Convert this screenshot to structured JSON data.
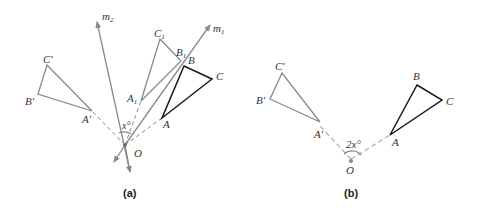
{
  "panel_a": {
    "caption": "(a)",
    "labels": {
      "m2": "m",
      "m2_sub": "2",
      "m1": "m",
      "m1_sub": "1",
      "C1": "C",
      "C1_sub": "1",
      "B1": "B",
      "B1_sub": "1",
      "A1": "A",
      "A1_sub": "1",
      "B": "B",
      "C": "C",
      "A": "A",
      "Cp": "C′",
      "Bp": "B′",
      "Ap": "A′",
      "O": "O",
      "angle": "x°"
    }
  },
  "panel_b": {
    "caption": "(b)",
    "labels": {
      "B": "B",
      "C": "C",
      "A": "A",
      "Cp": "C′",
      "Bp": "B′",
      "Ap": "A′",
      "O": "O",
      "angle": "2x°"
    }
  }
}
